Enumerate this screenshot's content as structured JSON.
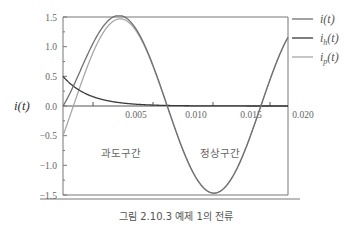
{
  "chart_data": {
    "type": "line",
    "title": "",
    "caption": "그림 2.10.3   예제 1의 전류",
    "xlabel": "",
    "ylabel": "i(t)",
    "xlim": [
      0,
      0.02
    ],
    "ylim": [
      -1.5,
      1.5
    ],
    "x_tick_labels": [
      "0.005",
      "0.010",
      "0.015",
      "0.020"
    ],
    "y_tick_labels": [
      "1.5",
      "1.0",
      "0.5",
      "0.0",
      "-0.5",
      "-1.0",
      "-1.5"
    ],
    "grid": false,
    "legend_position": "right-top",
    "annotations": [
      "과도구간",
      "정상구간"
    ],
    "x": [
      0,
      0.001,
      0.002,
      0.003,
      0.004,
      0.005,
      0.006,
      0.007,
      0.008,
      0.009,
      0.01,
      0.011,
      0.012,
      0.013,
      0.014,
      0.015,
      0.016,
      0.017,
      0.018,
      0.019,
      0.02
    ],
    "series": [
      {
        "name": "i(t)",
        "color": "#707070",
        "values": [
          0.0,
          0.37,
          0.8,
          1.15,
          1.38,
          1.45,
          1.34,
          1.08,
          0.7,
          0.25,
          -0.24,
          -0.7,
          -1.11,
          -1.37,
          -1.47,
          -1.38,
          -1.11,
          -0.71,
          -0.22,
          0.28,
          0.74
        ]
      },
      {
        "name": "i_h(t)",
        "color": "#3a3a3a",
        "values": [
          0.5,
          0.32,
          0.21,
          0.14,
          0.09,
          0.06,
          0.04,
          0.025,
          0.016,
          0.01,
          0.007,
          0.004,
          0.003,
          0.002,
          0.001,
          0.001,
          0.0,
          0.0,
          0.0,
          0.0,
          0.0
        ]
      },
      {
        "name": "i_p(t)",
        "color": "#a8a8a8",
        "values": [
          -0.5,
          0.05,
          0.59,
          1.01,
          1.29,
          1.39,
          1.3,
          1.06,
          0.68,
          0.24,
          -0.25,
          -0.7,
          -1.11,
          -1.37,
          -1.47,
          -1.38,
          -1.11,
          -0.71,
          -0.22,
          0.28,
          0.74
        ]
      }
    ]
  },
  "labels": {
    "ylabel": "i(t)",
    "region_transient": "과도구간",
    "region_steady": "정상구간",
    "caption": "그림 2.10.3   예제 1의 전류",
    "legend": [
      "i(t)",
      "i",
      "(t)",
      "h",
      "p"
    ]
  }
}
